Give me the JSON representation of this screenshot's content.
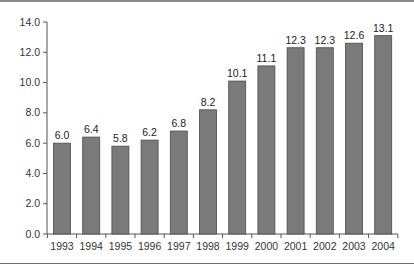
{
  "chart_data": {
    "type": "bar",
    "title": "",
    "xlabel": "",
    "ylabel": "",
    "categories": [
      "1993",
      "1994",
      "1995",
      "1996",
      "1997",
      "1998",
      "1999",
      "2000",
      "2001",
      "2002",
      "2003",
      "2004"
    ],
    "values": [
      6.0,
      6.4,
      5.8,
      6.2,
      6.8,
      8.2,
      10.1,
      11.1,
      12.3,
      12.3,
      12.6,
      13.1
    ],
    "value_labels": [
      "6.0",
      "6.4",
      "5.8",
      "6.2",
      "6.8",
      "8.2",
      "10.1",
      "11.1",
      "12.3",
      "12.3",
      "12.6",
      "13.1"
    ],
    "ylim": [
      0,
      14
    ],
    "yticks": [
      0,
      2,
      4,
      6,
      8,
      10,
      12,
      14
    ],
    "ytick_labels": [
      "0.0",
      "2.0",
      "4.0",
      "6.0",
      "8.0",
      "10.0",
      "12.0",
      "14.0"
    ],
    "grid": false,
    "legend": null,
    "bar_color": "#7a7a7a"
  }
}
